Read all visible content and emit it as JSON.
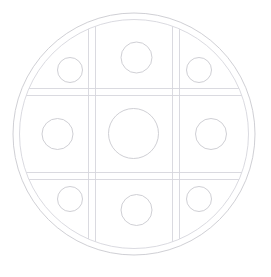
{
  "canvas": {
    "width": 271,
    "height": 277,
    "background": "#ffffff",
    "title": "Circular Plate With 3x3 Grid And Wells"
  },
  "style": {
    "stroke": "#c9c9cf",
    "stroke_dark": "#b9b9c2",
    "stroke_light": "#d6d6dc",
    "fill": "none",
    "outer_rim_width": 0.9,
    "grid_width": 0.9,
    "well_width": 0.9
  },
  "chart_data": {
    "type": "diagram",
    "title": "Circular Plate With 3x3 Grid And Wells",
    "xlabel": "",
    "ylabel": "",
    "grid": true,
    "legend": "none",
    "plate": {
      "center_x": 134,
      "center_y": 134,
      "outer_radius": 121,
      "inner_radius": 114.5
    },
    "grid_lines": {
      "vertical_pairs": [
        [
          88.5,
          95.5
        ],
        [
          172.5,
          179.5
        ]
      ],
      "horizontal_pairs": [
        [
          88.5,
          95.5
        ],
        [
          172.5,
          179.5
        ]
      ],
      "extent_note": "lines are clipped to the inner plate circle"
    },
    "center_cell": {
      "x": 95.5,
      "y": 95.5,
      "width": 77,
      "height": 77
    },
    "wells": [
      {
        "name": "well-top-left",
        "row": 0,
        "col": 0,
        "cx": 70,
        "cy": 70,
        "r": 12.5
      },
      {
        "name": "well-top-center",
        "row": 0,
        "col": 1,
        "cx": 136.5,
        "cy": 57.5,
        "r": 15.5
      },
      {
        "name": "well-top-right",
        "row": 0,
        "col": 2,
        "cx": 199,
        "cy": 70,
        "r": 12.5
      },
      {
        "name": "well-middle-left",
        "row": 1,
        "col": 0,
        "cx": 57.5,
        "cy": 134,
        "r": 15.5
      },
      {
        "name": "well-center",
        "row": 1,
        "col": 1,
        "cx": 133.5,
        "cy": 133.5,
        "r": 25.0
      },
      {
        "name": "well-middle-right",
        "row": 1,
        "col": 2,
        "cx": 211,
        "cy": 134,
        "r": 15.5
      },
      {
        "name": "well-bottom-left",
        "row": 2,
        "col": 0,
        "cx": 70,
        "cy": 199,
        "r": 12.5
      },
      {
        "name": "well-bottom-center",
        "row": 2,
        "col": 1,
        "cx": 136.5,
        "cy": 210,
        "r": 15.5
      },
      {
        "name": "well-bottom-right",
        "row": 2,
        "col": 2,
        "cx": 199,
        "cy": 199,
        "r": 12.5
      }
    ],
    "counts": {
      "rings": 2,
      "grid_line_pairs": 4,
      "wells_total": 9,
      "wells_small": 4,
      "wells_medium": 4,
      "wells_large": 1
    }
  }
}
